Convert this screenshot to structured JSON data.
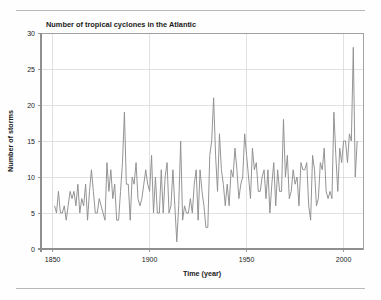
{
  "page": {
    "top_rule": true,
    "bottom_rule": true,
    "background_color": "#fefefe"
  },
  "chart_data": {
    "type": "line",
    "title": "Number of tropical cyclones in the Atlantic",
    "xlabel": "Time (year)",
    "ylabel": "Number of storms",
    "xlim": [
      1844,
      2010
    ],
    "ylim": [
      0,
      30
    ],
    "xticks": [
      1850,
      1900,
      1950,
      2000
    ],
    "xtick_labels": [
      "1850",
      "1900",
      "1950",
      "2000"
    ],
    "yticks": [
      0,
      5,
      10,
      15,
      20,
      25,
      30
    ],
    "ytick_labels": [
      "0",
      "5",
      "10",
      "15",
      "20",
      "25",
      "30"
    ],
    "grid": true,
    "legend": null,
    "line_color": "#8e8e8e",
    "grid_color": "#d4d4d4",
    "axis_color": "#8f8f8f",
    "series": [
      {
        "name": "Number of storms",
        "x": [
          1851,
          1852,
          1853,
          1854,
          1855,
          1856,
          1857,
          1858,
          1859,
          1860,
          1861,
          1862,
          1863,
          1864,
          1865,
          1866,
          1867,
          1868,
          1869,
          1870,
          1871,
          1872,
          1873,
          1874,
          1875,
          1876,
          1877,
          1878,
          1879,
          1880,
          1881,
          1882,
          1883,
          1884,
          1885,
          1886,
          1887,
          1888,
          1889,
          1890,
          1891,
          1892,
          1893,
          1894,
          1895,
          1896,
          1897,
          1898,
          1899,
          1900,
          1901,
          1902,
          1903,
          1904,
          1905,
          1906,
          1907,
          1908,
          1909,
          1910,
          1911,
          1912,
          1913,
          1914,
          1915,
          1916,
          1917,
          1918,
          1919,
          1920,
          1921,
          1922,
          1923,
          1924,
          1925,
          1926,
          1927,
          1928,
          1929,
          1930,
          1931,
          1932,
          1933,
          1934,
          1935,
          1936,
          1937,
          1938,
          1939,
          1940,
          1941,
          1942,
          1943,
          1944,
          1945,
          1946,
          1947,
          1948,
          1949,
          1950,
          1951,
          1952,
          1953,
          1954,
          1955,
          1956,
          1957,
          1958,
          1959,
          1960,
          1961,
          1962,
          1963,
          1964,
          1965,
          1966,
          1967,
          1968,
          1969,
          1970,
          1971,
          1972,
          1973,
          1974,
          1975,
          1976,
          1977,
          1978,
          1979,
          1980,
          1981,
          1982,
          1983,
          1984,
          1985,
          1986,
          1987,
          1988,
          1989,
          1990,
          1991,
          1992,
          1993,
          1994,
          1995,
          1996,
          1997,
          1998,
          1999,
          2000,
          2001,
          2002,
          2003,
          2004,
          2005,
          2006,
          2007
        ],
        "values": [
          6,
          5,
          8,
          5,
          5,
          6,
          4,
          6,
          8,
          7,
          8,
          6,
          9,
          5,
          7,
          6,
          9,
          4,
          8,
          11,
          8,
          5,
          5,
          7,
          6,
          5,
          4,
          12,
          8,
          11,
          7,
          9,
          4,
          4,
          8,
          12,
          19,
          9,
          9,
          4,
          10,
          9,
          12,
          7,
          6,
          7,
          9,
          11,
          9,
          8,
          13,
          5,
          10,
          5,
          5,
          11,
          5,
          10,
          12,
          5,
          6,
          11,
          6,
          1,
          6,
          15,
          4,
          6,
          5,
          5,
          7,
          5,
          9,
          11,
          4,
          11,
          8,
          6,
          3,
          3,
          13,
          15,
          21,
          13,
          8,
          16,
          11,
          9,
          6,
          9,
          6,
          11,
          10,
          14,
          11,
          7,
          9,
          10,
          16,
          13,
          10,
          7,
          14,
          11,
          12,
          8,
          8,
          10,
          11,
          7,
          11,
          5,
          9,
          12,
          6,
          11,
          8,
          8,
          18,
          10,
          13,
          7,
          8,
          11,
          9,
          10,
          6,
          12,
          11,
          11,
          12,
          6,
          4,
          13,
          11,
          6,
          7,
          12,
          11,
          14,
          8,
          7,
          8,
          7,
          19,
          13,
          8,
          14,
          12,
          15,
          15,
          12,
          16,
          15,
          28,
          10,
          15
        ]
      }
    ]
  },
  "geometry": {
    "plot_left": 41,
    "plot_right": 363,
    "plot_top": 33,
    "plot_bottom": 249
  }
}
